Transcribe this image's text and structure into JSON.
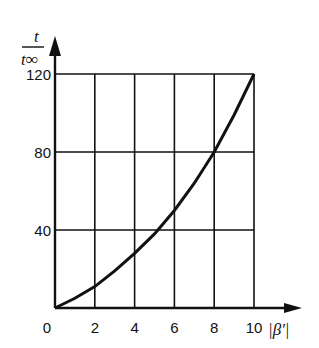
{
  "chart_data": {
    "type": "line",
    "title": "",
    "xlabel": "|β′|",
    "ylabel_num": "t",
    "ylabel_den": "t∞",
    "x_ticks": [
      "0",
      "2",
      "4",
      "6",
      "8",
      "10"
    ],
    "y_ticks": [
      "40",
      "80",
      "120"
    ],
    "xlim": [
      0,
      10
    ],
    "ylim": [
      0,
      120
    ],
    "grid": true,
    "legend": "none",
    "series": [
      {
        "name": "t/t∞",
        "x": [
          0,
          1,
          2,
          3,
          4,
          5,
          6,
          7,
          8,
          9,
          10
        ],
        "y": [
          0,
          5,
          11,
          19,
          28,
          38,
          50,
          64,
          80,
          99,
          120
        ]
      }
    ]
  }
}
